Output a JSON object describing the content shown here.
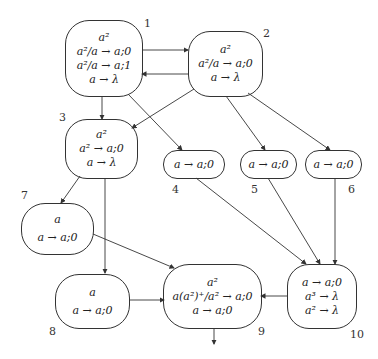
{
  "diagram": {
    "nodes": [
      {
        "id": "1",
        "lines": [
          "a²",
          "a²/a → a;0",
          "a²/a → a;1",
          "a → λ"
        ]
      },
      {
        "id": "2",
        "lines": [
          "a²",
          "a²/a → a;0",
          "a → λ"
        ]
      },
      {
        "id": "3",
        "lines": [
          "a²",
          "a² → a;0",
          "a → λ"
        ]
      },
      {
        "id": "4",
        "lines": [
          "a → a;0"
        ]
      },
      {
        "id": "5",
        "lines": [
          "a → a;0"
        ]
      },
      {
        "id": "6",
        "lines": [
          "a → a;0"
        ]
      },
      {
        "id": "7",
        "lines": [
          "a",
          "a → a;0"
        ]
      },
      {
        "id": "8",
        "lines": [
          "a",
          "a → a;0"
        ]
      },
      {
        "id": "9",
        "lines": [
          "a²",
          "a(a²)⁺/a² → a;0",
          "a → a;0"
        ]
      },
      {
        "id": "10",
        "lines": [
          "a → a;0",
          "a³ → λ",
          "a² → λ"
        ]
      }
    ],
    "edges": [
      [
        "1",
        "2"
      ],
      [
        "2",
        "1"
      ],
      [
        "1",
        "3"
      ],
      [
        "1",
        "4"
      ],
      [
        "2",
        "3"
      ],
      [
        "2",
        "5"
      ],
      [
        "2",
        "6"
      ],
      [
        "3",
        "7"
      ],
      [
        "3",
        "8"
      ],
      [
        "7",
        "9"
      ],
      [
        "8",
        "9"
      ],
      [
        "4",
        "10"
      ],
      [
        "5",
        "10"
      ],
      [
        "6",
        "10"
      ],
      [
        "10",
        "9"
      ],
      [
        "9",
        "output"
      ]
    ]
  }
}
